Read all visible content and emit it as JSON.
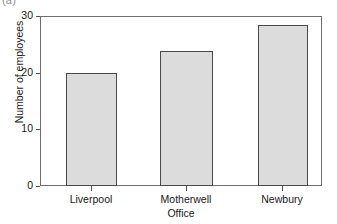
{
  "panel": {
    "label": "(a)"
  },
  "chart_data": {
    "type": "bar",
    "title": "",
    "subtitle": "",
    "xlabel": "Office",
    "ylabel": "Number of employees",
    "categories": [
      "Liverpool",
      "Motherwell",
      "Newbury"
    ],
    "values": [
      20,
      24,
      28.5
    ],
    "series": [
      {
        "name": "Number of employees",
        "values": [
          20,
          24,
          28.5
        ]
      }
    ],
    "ylim": [
      0,
      30
    ],
    "yticks": [
      0,
      10,
      20,
      30
    ],
    "ytick_labels": [
      "0",
      "10",
      "20",
      "30"
    ],
    "grid": false,
    "legend": false,
    "legend_position": "none",
    "bar_fill_color": "#dcdcdc",
    "bar_edge_color": "#4a4a4a",
    "axis_color": "#6e6e6e",
    "background_color": "#ffffff",
    "annotations": []
  }
}
